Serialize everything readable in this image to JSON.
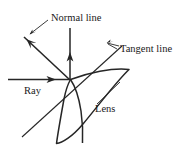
{
  "figure": {
    "background_color": "#ffffff",
    "ink_color": "#262626",
    "labels": {
      "normal_line": "Normal line",
      "tangent_line": "Tangent line",
      "ray": "Ray",
      "lens": "Lens"
    },
    "elements": {
      "incidence_point": "incidence-point",
      "incident_ray": "incident-ray-arrow",
      "reflected_ray": "reflected-ray-arrow",
      "normal": "normal-line-arrow",
      "tangent": "tangent-line",
      "lens_body": "lens-outline"
    },
    "geometry": {
      "incidence_point_x": 70,
      "incidence_point_y": 80,
      "normal_top_y": 28,
      "ray_start_x": 8,
      "tangent_angle_deg": 42,
      "lens_top_tip_x": 129,
      "lens_top_tip_y": 70,
      "lens_bottom_tip_x": 56,
      "lens_bottom_tip_y": 143
    }
  }
}
